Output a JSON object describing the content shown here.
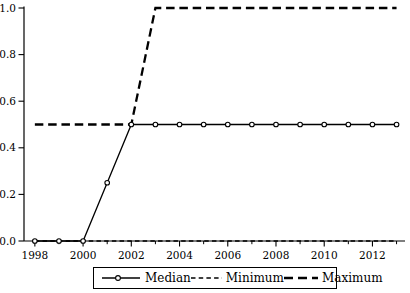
{
  "chart_data": {
    "type": "line",
    "x": [
      1998,
      1999,
      2000,
      2001,
      2002,
      2003,
      2004,
      2005,
      2006,
      2007,
      2008,
      2009,
      2010,
      2011,
      2012,
      2013
    ],
    "series": [
      {
        "name": "Median",
        "line_style": "solid",
        "marker": "circle",
        "values": [
          0,
          0,
          0,
          0.25,
          0.5,
          0.5,
          0.5,
          0.5,
          0.5,
          0.5,
          0.5,
          0.5,
          0.5,
          0.5,
          0.5,
          0.5
        ]
      },
      {
        "name": "Minimum",
        "line_style": "short-dash",
        "marker": "none",
        "values": [
          0,
          0,
          0,
          0,
          0,
          0,
          0,
          0,
          0,
          0,
          0,
          0,
          0,
          0,
          0,
          0
        ]
      },
      {
        "name": "Maximum",
        "line_style": "long-dash",
        "marker": "none",
        "values": [
          0.5,
          0.5,
          0.5,
          0.5,
          0.5,
          1,
          1,
          1,
          1,
          1,
          1,
          1,
          1,
          1,
          1,
          1
        ]
      }
    ],
    "title": "",
    "xlabel": "",
    "ylabel": "",
    "xlim": [
      1997.55,
      2013.35
    ],
    "ylim": [
      0,
      1
    ],
    "ytick_values": [
      0,
      0.2,
      0.4,
      0.6,
      0.8,
      1
    ],
    "ytick_labels": [
      "0.0",
      "0.2",
      "0.4",
      "0.6",
      "0.8",
      "1.0"
    ],
    "xtick_major_values": [
      1998,
      2000,
      2002,
      2004,
      2006,
      2008,
      2010,
      2012
    ],
    "xtick_major_labels": [
      "1998",
      "2000",
      "2002",
      "2004",
      "2006",
      "2008",
      "2010",
      "2012"
    ],
    "xtick_minor_values": [
      1999,
      2001,
      2003,
      2005,
      2007,
      2009,
      2011,
      2013
    ],
    "grid": "off",
    "legend_position": "bottom",
    "colors": {
      "foreground": "#000000",
      "background": "#ffffff"
    }
  }
}
